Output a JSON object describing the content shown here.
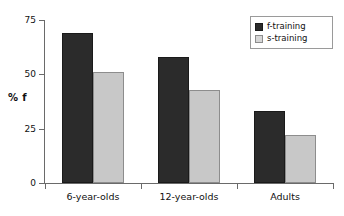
{
  "chart_data": {
    "type": "bar",
    "title": "",
    "xlabel": "",
    "ylabel": "% f",
    "categories": [
      "6-year-olds",
      "12-year-olds",
      "Adults"
    ],
    "series": [
      {
        "name": "f-training",
        "color": "#2b2b2b",
        "values": [
          69,
          58,
          33
        ]
      },
      {
        "name": "s-training",
        "color": "#c8c8c8",
        "values": [
          51,
          43,
          22
        ]
      }
    ],
    "ylim": [
      0,
      75
    ],
    "yticks": [
      0,
      25,
      50,
      75
    ],
    "ytick_labels": [
      "0",
      "25",
      "50",
      "75"
    ],
    "grid": false,
    "legend_position": "top-right"
  },
  "legend": {
    "items": [
      {
        "label": "f-training"
      },
      {
        "label": "s-training"
      }
    ]
  },
  "axes": {
    "y_title": "% f"
  }
}
